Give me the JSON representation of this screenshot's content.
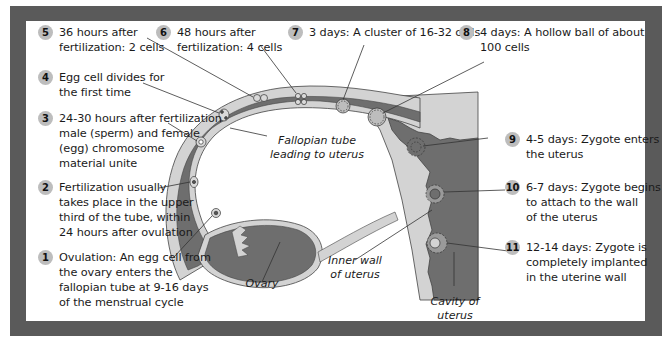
{
  "figure": {
    "colors": {
      "frame": "#5a5a5a",
      "panel": "#ffffff",
      "tube_wall": "#d3d3d3",
      "tube_lumen": "#6e6e6e",
      "badge": "#bdbdbd",
      "leader_line": "#333333"
    },
    "steps": [
      {
        "number": "1",
        "text": "Ovulation: An egg cell from\nthe ovary enters the\nfallopian tube at 9-16 days\nof the menstrual cycle"
      },
      {
        "number": "2",
        "text": "Fertilization usually\ntakes place in the upper\nthird of the tube, within\n24 hours after ovulation"
      },
      {
        "number": "3",
        "text": "24-30 hours after fertilization\nmale (sperm) and female\n(egg) chromosome\nmaterial unite"
      },
      {
        "number": "4",
        "text": "Egg cell divides for\nthe first time"
      },
      {
        "number": "5",
        "text": "36 hours after\nfertilization: 2 cells"
      },
      {
        "number": "6",
        "text": "48 hours after\nfertilization: 4 cells"
      },
      {
        "number": "7",
        "text": "3 days: A cluster of 16-32 cells"
      },
      {
        "number": "8",
        "text": "4 days: A hollow ball of about\n100 cells"
      },
      {
        "number": "9",
        "text": "4-5 days: Zygote enters\nthe uterus"
      },
      {
        "number": "10",
        "text": "6-7 days: Zygote begins\nto attach to the wall\nof the uterus"
      },
      {
        "number": "11",
        "text": "12-14 days: Zygote is\ncompletely implanted\nin the uterine wall"
      }
    ],
    "anatomy_labels": {
      "fallopian_tube": "Fallopian tube\nleading to uterus",
      "ovary": "Ovary",
      "inner_wall": "Inner wall\nof uterus",
      "cavity": "Cavity of\nuterus"
    }
  }
}
